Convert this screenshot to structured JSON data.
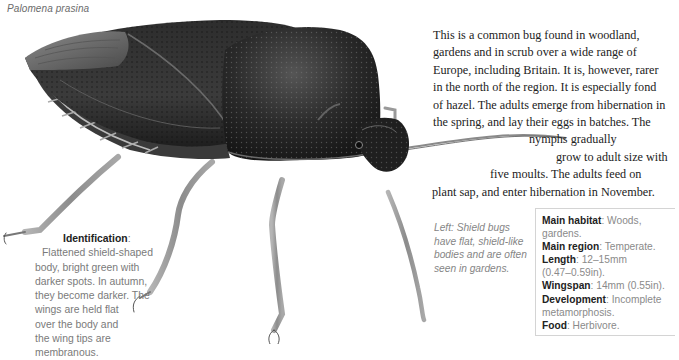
{
  "species_name": "Palomena prasina",
  "body_text": {
    "lines": [
      "This is a common bug found in woodland,",
      "gardens and in scrub over a wide range of",
      "Europe, including Britain. It is, however, rarer",
      "in the north of the region. It is especially fond",
      "of hazel. The adults emerge from hibernation in",
      "the spring, and lay their eggs in batches. The",
      "nymphs gradually",
      "grow to adult size with",
      "five moults. The adults feed on",
      "plant sap, and enter hibernation in November."
    ]
  },
  "identification": {
    "heading": "Identification",
    "separator": ":",
    "lines": [
      "Flattened shield-shaped",
      "body, bright green with",
      "darker spots. In autumn,",
      "they become darker. The",
      "wings are held flat",
      "over the body and",
      "the wing tips are",
      "membranous."
    ]
  },
  "caption": {
    "lines": [
      "Left: Shield bugs",
      "have flat, shield-like",
      "bodies and are often",
      "seen in gardens."
    ]
  },
  "factbox": {
    "rows": [
      {
        "key": "Main habitat",
        "lines": [
          "Woods,",
          "gardens."
        ]
      },
      {
        "key": "Main region",
        "lines": [
          "Temperate."
        ]
      },
      {
        "key": "Length",
        "lines": [
          "12–15mm",
          "(0.47–0.59in)."
        ]
      },
      {
        "key": "Wingspan",
        "lines": [
          "14mm (0.55in)."
        ]
      },
      {
        "key": "Development",
        "lines": [
          "Incomplete",
          "metamorphosis."
        ]
      },
      {
        "key": "Food",
        "lines": [
          "Herbivore."
        ]
      }
    ]
  },
  "illustration": {
    "subject": "shield-bug-illustration",
    "palette": {
      "body_dark": "#1c1c1c",
      "body_mid": "#3a3a3a",
      "wing_membrane": "#6e6e6e",
      "legs": "#9a9a9a"
    }
  }
}
